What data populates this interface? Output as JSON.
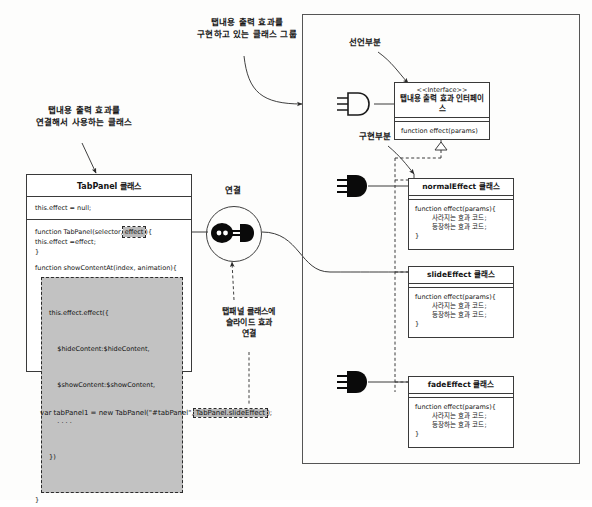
{
  "annotations": {
    "left_class_note": "탭내용 출력 효과를\n연결해서 사용하는 클래스",
    "group_note": "탭내용 출력 효과를\n구현하고 있는 클래스 그룹",
    "connect_label": "연결",
    "declaration_label": "선언부분",
    "implementation_label": "구현부분",
    "bottom_note": "탭패널 클래스에\n슬라이드 효과\n연결"
  },
  "tab_panel_class": {
    "title": "TabPanel 클래스",
    "attribute": "this.effect = null;",
    "constructor_prefix": "function TabPanel(selector,",
    "constructor_param": "effect",
    "constructor_suffix": "){",
    "constructor_body": "this.effect =effect;",
    "constructor_close": "}",
    "method_signature": "function showContentAt(index, animation){",
    "method_close": "}",
    "highlighted_code": [
      "this.effect.effect({",
      "    $hideContent:$hideContent,",
      "    $showContent:$showContent,",
      "    . . . .",
      "})"
    ]
  },
  "bottom_code": {
    "prefix": "var tabPanel1 = new TabPanel(\"#tabPanel\",",
    "highlight": "TabPanel.slideEffect",
    "suffix": ");"
  },
  "interface_class": {
    "stereotype": "<<Interface>>",
    "title": "탭내용 출력 효과 인터페이스",
    "operation": "function effect(params)"
  },
  "impl_classes": [
    {
      "title": "normalEffect 클래스",
      "code": [
        "function effect(params){",
        "    사라지는 효과 코드;",
        "    등장하는 효과 코드;",
        "}"
      ],
      "plug": "plug-filled"
    },
    {
      "title": "slideEffect 클래스",
      "code": [
        "function effect(params){",
        "    사라지는 효과 코드;",
        "    등장하는 효과 코드;",
        "}"
      ],
      "plug": "none"
    },
    {
      "title": "fadeEffect 클래스",
      "code": [
        "function effect(params){",
        "    사라지는 효과 코드;",
        "    등장하는 효과 코드;",
        "}"
      ],
      "plug": "plug-filled"
    }
  ],
  "icons": {
    "socket": "socket-outline-icon",
    "plug": "plug-filled-icon",
    "hub_plug": "plug-connected-icon"
  },
  "colors": {
    "stroke": "#3a3a3a",
    "highlight_fill": "#bdbdbd",
    "paper": "#fdfdfc"
  }
}
